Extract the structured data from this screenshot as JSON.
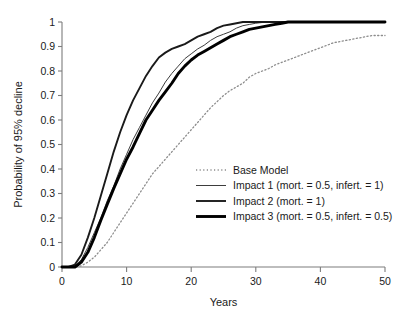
{
  "chart_data": {
    "type": "line",
    "title": "",
    "xlabel": "Years",
    "ylabel": "Probability of 95% decline",
    "xlim": [
      0,
      50
    ],
    "ylim": [
      0,
      1
    ],
    "xticks": [
      0,
      10,
      20,
      30,
      40,
      50
    ],
    "xtick_labels": [
      "0",
      "10",
      "20",
      "30",
      "40",
      "50"
    ],
    "yticks": [
      0,
      0.1,
      0.2,
      0.3,
      0.4,
      0.5,
      0.6,
      0.7,
      0.8,
      0.9,
      1
    ],
    "ytick_labels": [
      "0",
      "0.1",
      "0.2",
      "0.3",
      "0.4",
      "0.5",
      "0.6",
      "0.7",
      "0.8",
      "0.9",
      "1"
    ],
    "grid": false,
    "legend_position": "lower-right-inside",
    "x": [
      0,
      1,
      2,
      3,
      4,
      5,
      6,
      7,
      8,
      9,
      10,
      11,
      12,
      13,
      14,
      15,
      16,
      17,
      18,
      19,
      20,
      21,
      22,
      23,
      24,
      25,
      26,
      27,
      28,
      29,
      30,
      31,
      32,
      33,
      34,
      35,
      36,
      37,
      38,
      39,
      40,
      41,
      42,
      43,
      44,
      45,
      46,
      47,
      48,
      49,
      50
    ],
    "series": [
      {
        "name": "Base Model",
        "style": "dotted",
        "color": "#8c8c8c",
        "width": 1.3,
        "values": [
          0,
          0,
          0,
          0.005,
          0.02,
          0.04,
          0.07,
          0.1,
          0.14,
          0.18,
          0.22,
          0.26,
          0.3,
          0.34,
          0.38,
          0.41,
          0.44,
          0.47,
          0.5,
          0.53,
          0.56,
          0.59,
          0.62,
          0.65,
          0.675,
          0.7,
          0.72,
          0.735,
          0.75,
          0.775,
          0.79,
          0.8,
          0.81,
          0.825,
          0.835,
          0.845,
          0.855,
          0.865,
          0.875,
          0.885,
          0.895,
          0.905,
          0.915,
          0.92,
          0.925,
          0.93,
          0.935,
          0.94,
          0.945,
          0.945,
          0.945
        ]
      },
      {
        "name": "Impact 1 (mort. = 0.5, infert. = 1)",
        "style": "solid",
        "color": "#3d3d3d",
        "width": 1.0,
        "values": [
          0,
          0,
          0.005,
          0.03,
          0.08,
          0.14,
          0.2,
          0.27,
          0.33,
          0.4,
          0.46,
          0.52,
          0.57,
          0.62,
          0.67,
          0.71,
          0.755,
          0.79,
          0.82,
          0.85,
          0.87,
          0.89,
          0.905,
          0.925,
          0.94,
          0.95,
          0.96,
          0.975,
          0.985,
          0.99,
          0.995,
          0.998,
          1,
          1,
          1,
          1,
          1,
          1,
          1,
          1,
          1,
          1,
          1,
          1,
          1,
          1,
          1,
          1,
          1,
          1,
          1
        ]
      },
      {
        "name": "Impact 2 (mort. = 1)",
        "style": "solid",
        "color": "#1a1a1a",
        "width": 1.9,
        "values": [
          0,
          0,
          0.01,
          0.05,
          0.12,
          0.2,
          0.29,
          0.38,
          0.47,
          0.55,
          0.62,
          0.68,
          0.73,
          0.78,
          0.82,
          0.855,
          0.875,
          0.89,
          0.9,
          0.91,
          0.925,
          0.94,
          0.95,
          0.96,
          0.975,
          0.985,
          0.99,
          0.995,
          1,
          1,
          1,
          1,
          1,
          1,
          1,
          1,
          1,
          1,
          1,
          1,
          1,
          1,
          1,
          1,
          1,
          1,
          1,
          1,
          1,
          1,
          1
        ]
      },
      {
        "name": "Impact 3 (mort. = 0.5, infert. = 0.5)",
        "style": "solid",
        "color": "#000000",
        "width": 2.9,
        "values": [
          0,
          0,
          0,
          0.02,
          0.06,
          0.12,
          0.19,
          0.255,
          0.32,
          0.38,
          0.44,
          0.49,
          0.545,
          0.6,
          0.64,
          0.68,
          0.715,
          0.75,
          0.79,
          0.82,
          0.845,
          0.865,
          0.88,
          0.895,
          0.91,
          0.925,
          0.94,
          0.95,
          0.96,
          0.97,
          0.975,
          0.98,
          0.985,
          0.99,
          0.995,
          1,
          1,
          1,
          1,
          1,
          1,
          1,
          1,
          1,
          1,
          1,
          1,
          1,
          1,
          1,
          1
        ]
      }
    ]
  },
  "legend": {
    "items": [
      {
        "label": "Base Model"
      },
      {
        "label": "Impact 1 (mort. = 0.5, infert. = 1)"
      },
      {
        "label": "Impact 2 (mort. = 1)"
      },
      {
        "label": "Impact 3 (mort. = 0.5, infert. = 0.5)"
      }
    ]
  }
}
